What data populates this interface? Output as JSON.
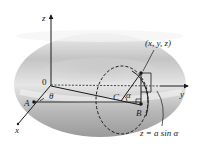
{
  "figure": {
    "labels": {
      "z_axis": "z",
      "y_axis": "y",
      "x_axis": "x",
      "origin": "0",
      "point_a": "A",
      "point_b": "B",
      "point_c": "C",
      "theta": "θ",
      "alpha": "α",
      "point_xyz": "(x, y, z)",
      "equation": "z = a sin α"
    },
    "colors": {
      "torus_light": "#f2f2f2",
      "torus_dark": "#a8a8a8",
      "ink": "#1a1a1a"
    }
  }
}
